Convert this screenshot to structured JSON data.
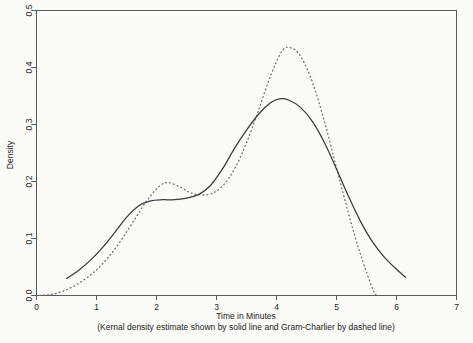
{
  "chart_data": {
    "type": "line",
    "title": "",
    "xlabel": "Time in Minutes",
    "ylabel": "Density",
    "caption": "(Kernal density estimate shown by solid line and Gram-Charlier by dashed line)",
    "xlim": [
      0,
      7
    ],
    "ylim": [
      0.0,
      0.5
    ],
    "xticks": [
      0,
      1,
      2,
      3,
      4,
      5,
      6,
      7
    ],
    "xticklabels": [
      "0",
      "1",
      "2",
      "3",
      "4",
      "5",
      "6",
      "7"
    ],
    "yticks": [
      0.0,
      0.1,
      0.2,
      0.3,
      0.4,
      0.5
    ],
    "yticklabels": [
      "0.0",
      "0.1",
      "0.2",
      "0.3",
      "0.4",
      "0.5"
    ],
    "grid": false,
    "legend_position": "none",
    "colors": {
      "solid_line": "#3a3a3a",
      "dotted_line": "#6b6b6b",
      "axis": "#5a5a5a",
      "background": "#fbfbf8"
    },
    "series": [
      {
        "name": "Kernal density estimate",
        "style": "solid",
        "x": [
          0.5,
          0.7,
          0.9,
          1.1,
          1.3,
          1.5,
          1.7,
          1.9,
          2.1,
          2.3,
          2.5,
          2.7,
          2.9,
          3.1,
          3.3,
          3.5,
          3.7,
          3.9,
          4.05,
          4.2,
          4.4,
          4.6,
          4.8,
          5.0,
          5.2,
          5.4,
          5.6,
          5.8,
          6.0,
          6.15
        ],
        "y": [
          0.03,
          0.044,
          0.062,
          0.084,
          0.11,
          0.137,
          0.157,
          0.166,
          0.168,
          0.168,
          0.171,
          0.177,
          0.193,
          0.222,
          0.258,
          0.29,
          0.318,
          0.338,
          0.345,
          0.343,
          0.33,
          0.305,
          0.268,
          0.222,
          0.174,
          0.13,
          0.094,
          0.067,
          0.046,
          0.032
        ]
      },
      {
        "name": "Gram-Charlier",
        "style": "dashed",
        "x": [
          0.05,
          0.25,
          0.45,
          0.65,
          0.85,
          1.05,
          1.25,
          1.45,
          1.65,
          1.85,
          2.05,
          2.2,
          2.4,
          2.55,
          2.7,
          2.9,
          3.1,
          3.3,
          3.5,
          3.7,
          3.9,
          4.1,
          4.25,
          4.4,
          4.6,
          4.8,
          5.0,
          5.2,
          5.4,
          5.6,
          5.67
        ],
        "y": [
          0.0,
          0.002,
          0.008,
          0.018,
          0.032,
          0.05,
          0.074,
          0.103,
          0.136,
          0.168,
          0.192,
          0.198,
          0.19,
          0.181,
          0.177,
          0.178,
          0.192,
          0.222,
          0.268,
          0.325,
          0.385,
          0.43,
          0.434,
          0.42,
          0.374,
          0.305,
          0.224,
          0.144,
          0.072,
          0.012,
          0.0
        ]
      }
    ],
    "annotations": {
      "solid_peak": {
        "x": 4.05,
        "y": 0.345
      },
      "dotted_peak": {
        "x": 4.2,
        "y": 0.434
      },
      "dotted_secondary_peak": {
        "x": 2.2,
        "y": 0.198
      },
      "solid_shoulder": {
        "x": 2.2,
        "y": 0.168
      }
    }
  }
}
